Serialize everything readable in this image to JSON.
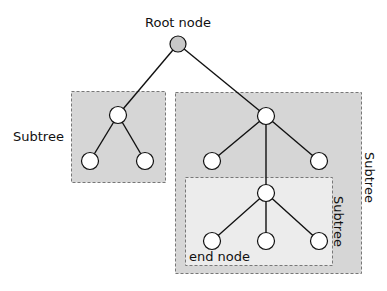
{
  "diagram": {
    "type": "tree",
    "title": "",
    "colors": {
      "background": "#ffffff",
      "outer_box_fill": "#d6d6d6",
      "inner_box_fill": "#ececec",
      "box_border": "#777777",
      "edge": "#111111",
      "root_fill": "#c8c8c8",
      "node_fill": "#ffffff",
      "node_stroke": "#111111"
    },
    "labels": {
      "root": "Root node",
      "left_subtree": "Subtree",
      "right_subtree": "Subtree",
      "inner_subtree": "Subtree",
      "end_node": "end node"
    },
    "nodes": [
      {
        "id": "root",
        "x": 178,
        "y": 44,
        "kind": "root"
      },
      {
        "id": "L",
        "x": 118,
        "y": 115
      },
      {
        "id": "L1",
        "x": 90,
        "y": 161
      },
      {
        "id": "L2",
        "x": 145,
        "y": 161
      },
      {
        "id": "R",
        "x": 266,
        "y": 116
      },
      {
        "id": "R1",
        "x": 212,
        "y": 161
      },
      {
        "id": "R2",
        "x": 319,
        "y": 161
      },
      {
        "id": "R3",
        "x": 266,
        "y": 193
      },
      {
        "id": "R3a",
        "x": 212,
        "y": 241
      },
      {
        "id": "R3b",
        "x": 266,
        "y": 241
      },
      {
        "id": "R3c",
        "x": 319,
        "y": 241
      }
    ],
    "edges": [
      [
        "root",
        "L"
      ],
      [
        "root",
        "R"
      ],
      [
        "L",
        "L1"
      ],
      [
        "L",
        "L2"
      ],
      [
        "R",
        "R1"
      ],
      [
        "R",
        "R2"
      ],
      [
        "R",
        "R3"
      ],
      [
        "R3",
        "R3a"
      ],
      [
        "R3",
        "R3b"
      ],
      [
        "R3",
        "R3c"
      ]
    ],
    "boxes": [
      {
        "id": "left-subtree-box",
        "x": 71,
        "y": 91,
        "w": 94,
        "h": 91,
        "label": "left_subtree"
      },
      {
        "id": "right-subtree-box",
        "x": 175,
        "y": 92,
        "w": 186,
        "h": 181,
        "label": "right_subtree"
      },
      {
        "id": "inner-subtree-box",
        "x": 185,
        "y": 177,
        "w": 147,
        "h": 88,
        "label": "inner_subtree"
      }
    ]
  }
}
